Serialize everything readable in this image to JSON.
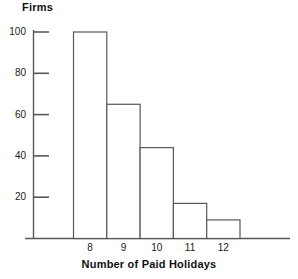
{
  "chart_data": {
    "type": "bar",
    "title": "",
    "subtitle": "",
    "xlabel": "Number of Paid Holidays",
    "ylabel": "Firms",
    "categories": [
      "8",
      "9",
      "10",
      "11",
      "12"
    ],
    "values": [
      100,
      65,
      44,
      17,
      9
    ],
    "series": [
      {
        "name": "Firms",
        "values": [
          100,
          65,
          44,
          17,
          9
        ]
      }
    ],
    "ylim": [
      0,
      104
    ],
    "xlim": [
      7.5,
      12.5
    ],
    "yticks": [
      20,
      40,
      60,
      80,
      100
    ],
    "ytick_labels": [
      "20",
      "40",
      "60",
      "80",
      "100"
    ],
    "xtick_labels": [
      "8",
      "9",
      "10",
      "11",
      "12"
    ],
    "grid": false,
    "legend": false,
    "legend_position": "none",
    "bar_style": {
      "fill": "#ffffff",
      "edge": "#585858",
      "edge_width": 1
    },
    "axis_color": "#585858",
    "text_color": "#111111",
    "note": "Histogram of firms by number of paid holidays; bars are adjacent with no gaps."
  }
}
